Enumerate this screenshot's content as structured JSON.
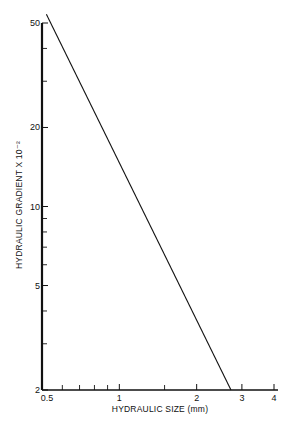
{
  "chart_data": {
    "type": "line",
    "title": "",
    "xlabel": "HYDRAULIC SIZE (mm)",
    "ylabel": "HYDRAULIC GRADIENT  X 10⁻²",
    "xscale": "log",
    "yscale": "log",
    "xlim": [
      0.5,
      4
    ],
    "ylim": [
      2,
      50
    ],
    "x_ticks": [
      0.5,
      1,
      2,
      3,
      4
    ],
    "x_tick_labels": [
      "0.5",
      "1",
      "2",
      "3",
      "4"
    ],
    "x_minor_ticks": [
      0.6,
      0.7,
      0.8,
      0.9,
      1.5
    ],
    "y_ticks": [
      2,
      5,
      10,
      20,
      50
    ],
    "y_tick_labels": [
      "2",
      "5",
      "10",
      "20",
      "50"
    ],
    "y_minor_ticks": [
      3,
      4,
      6,
      7,
      8,
      9,
      30,
      40
    ],
    "grid": false,
    "legend": null,
    "series": [
      {
        "name": "gradient vs size",
        "x": [
          0.52,
          2.72
        ],
        "y": [
          54,
          2
        ]
      }
    ]
  }
}
